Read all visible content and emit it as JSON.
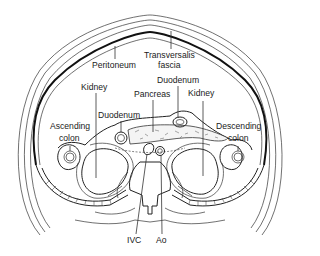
{
  "diagram": {
    "labels": {
      "peritoneum": "Peritoneum",
      "transversalis_fascia_1": "Transversalis",
      "transversalis_fascia_2": "fascia",
      "duodenum_right": "Duodenum",
      "kidney_left": "Kidney",
      "pancreas": "Pancreas",
      "kidney_right": "Kidney",
      "duodenum_left": "Duodenum",
      "ascending_colon_1": "Ascending",
      "ascending_colon_2": "colon",
      "descending_colon_1": "Descending",
      "descending_colon_2": "colon",
      "ivc": "IVC",
      "aorta": "Ao"
    },
    "colors": {
      "background": "#ffffff",
      "line": "#222222"
    }
  }
}
